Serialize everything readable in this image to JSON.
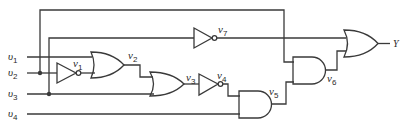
{
  "diagram": {
    "type": "logic-circuit",
    "inputs": [
      {
        "id": "u1",
        "letter": "υ",
        "sub": "1"
      },
      {
        "id": "u2",
        "letter": "υ",
        "sub": "2"
      },
      {
        "id": "u3",
        "letter": "υ",
        "sub": "3"
      },
      {
        "id": "u4",
        "letter": "υ",
        "sub": "4"
      }
    ],
    "gates": [
      {
        "id": "v1",
        "type": "NOT",
        "letter": "v",
        "sub": "1",
        "inputs": [
          "u2"
        ]
      },
      {
        "id": "v2",
        "type": "OR",
        "letter": "v",
        "sub": "2",
        "inputs": [
          "u1",
          "v1"
        ]
      },
      {
        "id": "v3",
        "type": "OR",
        "letter": "v",
        "sub": "3",
        "inputs": [
          "v2",
          "u3"
        ]
      },
      {
        "id": "v4",
        "type": "NOT",
        "letter": "v",
        "sub": "4",
        "inputs": [
          "v3"
        ]
      },
      {
        "id": "v5",
        "type": "AND",
        "letter": "v",
        "sub": "5",
        "inputs": [
          "v4",
          "u4"
        ]
      },
      {
        "id": "v6",
        "type": "AND",
        "letter": "v",
        "sub": "6",
        "inputs": [
          "u2",
          "v5"
        ]
      },
      {
        "id": "v7",
        "type": "NOT",
        "letter": "v",
        "sub": "7",
        "inputs": [
          "u3"
        ]
      },
      {
        "id": "Y",
        "type": "OR",
        "inputs": [
          "v7",
          "v6"
        ]
      }
    ],
    "output": {
      "label": "Y"
    },
    "colors": {
      "line": "#3a3a3a",
      "background": "#ffffff"
    }
  }
}
